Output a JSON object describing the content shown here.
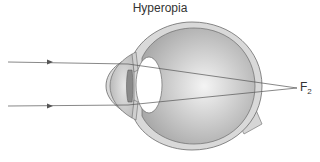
{
  "diagram": {
    "title": "Hyperopia",
    "focal_point_label": "F",
    "focal_point_subscript": "2",
    "rays": [
      {
        "name": "upper-ray",
        "start_y": 62,
        "direction": "right"
      },
      {
        "name": "lower-ray",
        "start_y": 106,
        "direction": "right"
      }
    ],
    "structures": [
      "cornea",
      "lens",
      "iris",
      "sclera",
      "vitreous body",
      "optic nerve"
    ],
    "colors": {
      "sclera": "#d9d9d9",
      "interior": "#bdbdbd",
      "outline": "#6b6b6b",
      "ray": "#555555",
      "lens": "#ffffff"
    }
  }
}
